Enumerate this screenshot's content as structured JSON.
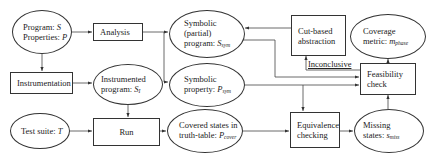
{
  "nodes": {
    "program": {
      "line1": "Program: ",
      "var1": "S",
      "line2": "Properties: ",
      "var2": "P",
      "shape": "ellipse"
    },
    "analysis": {
      "label": "Analysis",
      "shape": "box"
    },
    "symbolic_program": {
      "line1": "Symbolic",
      "line2": "(partial)",
      "line3": "program: ",
      "var": "S",
      "sub": "sym",
      "shape": "ellipse"
    },
    "cut_abstraction": {
      "line1": "Cut-based",
      "line2": "abstraction",
      "shape": "box"
    },
    "coverage_metric": {
      "line1": "Coverage",
      "line2": "metric: ",
      "var": "m",
      "sub": "phase",
      "shape": "ellipse"
    },
    "instrumentation": {
      "label": "Instrumentation",
      "shape": "box"
    },
    "instrumented_program": {
      "line1": "Instrumented",
      "line2": "program: ",
      "var": "S",
      "sub": "I",
      "shape": "ellipse"
    },
    "symbolic_property": {
      "line1": "Symbolic",
      "line2": "property: ",
      "var": "P",
      "sub": "sym",
      "shape": "ellipse"
    },
    "feasibility": {
      "line1": "Feasibility",
      "line2": "check",
      "shape": "box"
    },
    "test_suite": {
      "line1": "Test suite: ",
      "var": "T",
      "shape": "ellipse"
    },
    "run": {
      "label": "Run",
      "shape": "box"
    },
    "covered_states": {
      "line1": "Covered states in",
      "line2": "truth-table: ",
      "var": "P",
      "sub": "cover",
      "shape": "ellipse"
    },
    "equivalence": {
      "line1": "Equivalence",
      "line2": "checking",
      "shape": "box"
    },
    "missing_states": {
      "line1": "Missing",
      "line2": "states: ",
      "var": "s",
      "sub": "miss",
      "shape": "ellipse"
    }
  },
  "edge_labels": {
    "inconclusive": "Inconclusive"
  },
  "edges": [
    {
      "from": "program",
      "to": "analysis"
    },
    {
      "from": "program",
      "to": "instrumentation"
    },
    {
      "from": "analysis",
      "to": "symbolic_program"
    },
    {
      "from": "analysis",
      "to": "symbolic_property"
    },
    {
      "from": "instrumentation",
      "to": "instrumented_program"
    },
    {
      "from": "instrumented_program",
      "to": "run"
    },
    {
      "from": "test_suite",
      "to": "run"
    },
    {
      "from": "run",
      "to": "covered_states"
    },
    {
      "from": "covered_states",
      "to": "equivalence"
    },
    {
      "from": "symbolic_property",
      "to": "equivalence"
    },
    {
      "from": "symbolic_property",
      "to": "feasibility"
    },
    {
      "from": "symbolic_program",
      "to": "feasibility"
    },
    {
      "from": "equivalence",
      "to": "missing_states"
    },
    {
      "from": "missing_states",
      "to": "feasibility"
    },
    {
      "from": "feasibility",
      "to": "coverage_metric"
    },
    {
      "from": "feasibility",
      "to": "cut_abstraction",
      "label": "Inconclusive"
    },
    {
      "from": "cut_abstraction",
      "to": "symbolic_program"
    }
  ]
}
